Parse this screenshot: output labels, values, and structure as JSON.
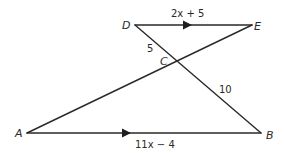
{
  "figure": {
    "type": "geometry",
    "points": {
      "D": {
        "label": "D",
        "x": 135,
        "y": 25
      },
      "E": {
        "label": "E",
        "x": 252,
        "y": 25
      },
      "A": {
        "label": "A",
        "x": 27,
        "y": 133
      },
      "B": {
        "label": "B",
        "x": 261,
        "y": 133
      },
      "C": {
        "label": "C",
        "x": 177,
        "y": 62
      }
    },
    "segments": [
      {
        "from": "D",
        "to": "E",
        "label": "2x + 5",
        "parallel_marker": true
      },
      {
        "from": "A",
        "to": "B",
        "label": "11x − 4",
        "parallel_marker": true
      },
      {
        "from": "D",
        "to": "B"
      },
      {
        "from": "E",
        "to": "A"
      }
    ],
    "measurements": {
      "DE": "2x + 5",
      "AB": "11x − 4",
      "DC": "5",
      "CB": "10"
    },
    "labels": {
      "D": "D",
      "E": "E",
      "A": "A",
      "B": "B",
      "C": "C",
      "de_length": "2x + 5",
      "ab_length": "11x − 4",
      "dc_length": "5",
      "cb_length": "10"
    },
    "colors": {
      "line": "#2a2a2a",
      "background": "#ffffff"
    }
  }
}
